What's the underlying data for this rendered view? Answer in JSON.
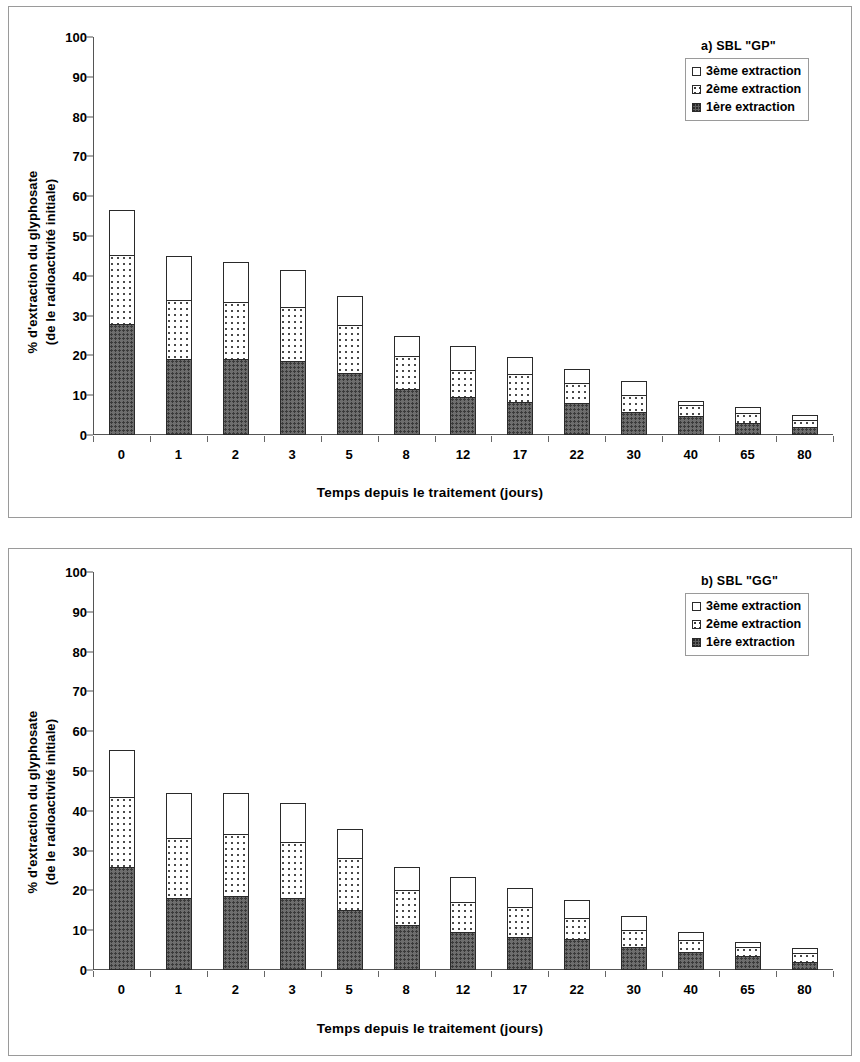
{
  "figure": {
    "ylabel_line1": "% d'extraction du glyphosate",
    "ylabel_line2": "(de le radioactivité initiale)",
    "xtitle": "Temps depuis le traitement (jours)"
  },
  "panel_a": {
    "legend_title": "a) SBL \"GP\"",
    "legend": [
      "3ème extraction",
      "2ème extraction",
      "1ère  extraction"
    ]
  },
  "panel_b": {
    "legend_title": "b) SBL \"GG\"",
    "legend": [
      "3ème extraction",
      "2ème extraction",
      "1ère  extraction"
    ]
  },
  "yticks": [
    "0",
    "10",
    "20",
    "30",
    "40",
    "50",
    "60",
    "70",
    "80",
    "90",
    "100"
  ],
  "chart_data": [
    {
      "type": "bar",
      "stacked": true,
      "title": "a) SBL \"GP\"",
      "xlabel": "Temps depuis le traitement (jours)",
      "ylabel": "% d'extraction du glyphosate (de le radioactivité initiale)",
      "ylim": [
        0,
        100
      ],
      "ytick_step": 10,
      "grid": false,
      "legend_position": "top-right",
      "categories": [
        "0",
        "1",
        "2",
        "3",
        "5",
        "8",
        "12",
        "17",
        "22",
        "30",
        "40",
        "65",
        "80"
      ],
      "series": [
        {
          "name": "1ère  extraction",
          "values": [
            28.0,
            19.2,
            19.2,
            18.5,
            15.5,
            11.5,
            9.5,
            8.2,
            8.0,
            5.8,
            4.8,
            3.0,
            2.0
          ]
        },
        {
          "name": "2ème extraction",
          "values": [
            17.5,
            15.0,
            14.6,
            13.8,
            12.5,
            8.5,
            7.2,
            7.3,
            5.2,
            4.4,
            3.1,
            2.7,
            2.0
          ]
        },
        {
          "name": "3ème extraction",
          "values": [
            11.5,
            11.3,
            10.2,
            9.7,
            7.5,
            5.5,
            6.3,
            4.5,
            4.0,
            3.8,
            1.1,
            1.8,
            1.5
          ]
        }
      ],
      "totals": [
        57.0,
        45.5,
        44.0,
        42.0,
        35.5,
        25.5,
        23.0,
        20.0,
        17.2,
        14.0,
        9.0,
        7.5,
        5.5
      ]
    },
    {
      "type": "bar",
      "stacked": true,
      "title": "b) SBL \"GG\"",
      "xlabel": "Temps depuis le traitement (jours)",
      "ylabel": "% d'extraction du glyphosate (de le radioactivité initiale)",
      "ylim": [
        0,
        100
      ],
      "ytick_step": 10,
      "grid": false,
      "legend_position": "top-right",
      "categories": [
        "0",
        "1",
        "2",
        "3",
        "5",
        "8",
        "12",
        "17",
        "22",
        "30",
        "40",
        "65",
        "80"
      ],
      "series": [
        {
          "name": "1ère  extraction",
          "values": [
            25.8,
            18.0,
            18.6,
            18.2,
            15.2,
            11.4,
            9.5,
            8.2,
            7.8,
            5.8,
            4.6,
            3.4,
            2.1
          ]
        },
        {
          "name": "2ème extraction",
          "values": [
            17.8,
            15.4,
            15.8,
            14.2,
            13.2,
            9.0,
            7.8,
            7.8,
            5.4,
            4.6,
            3.2,
            2.6,
            2.5
          ]
        },
        {
          "name": "3ème extraction",
          "values": [
            12.2,
            11.5,
            10.6,
            10.0,
            7.6,
            6.0,
            6.6,
            5.0,
            4.8,
            3.6,
            2.2,
            1.6,
            1.4
          ]
        }
      ],
      "totals": [
        55.8,
        44.9,
        45.0,
        42.4,
        36.0,
        26.4,
        23.9,
        21.0,
        18.0,
        14.0,
        10.0,
        7.6,
        6.0
      ]
    }
  ]
}
